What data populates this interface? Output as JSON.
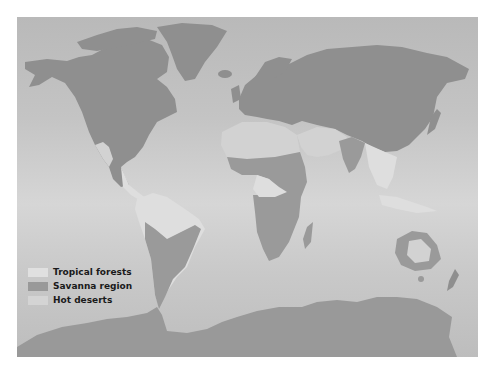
{
  "map": {
    "type": "world-biome-map",
    "colors": {
      "ocean": "#c6c6c6",
      "temperate_land": "#8f8f8f",
      "tropical_forests": "#dedede",
      "savanna_region": "#9a9a9a",
      "hot_deserts": "#d2d2d2"
    }
  },
  "legend": {
    "items": [
      {
        "label": "Tropical forests",
        "color": "#e0e0e0"
      },
      {
        "label": "Savanna region",
        "color": "#999999"
      },
      {
        "label": "Hot deserts",
        "color": "#d4d4d4"
      }
    ]
  }
}
